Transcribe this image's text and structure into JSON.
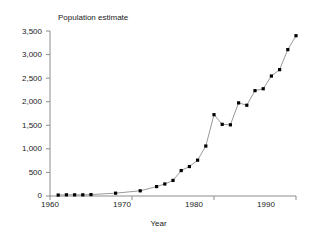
{
  "chart_data": {
    "type": "line",
    "title": "Population estimate",
    "xlabel": "Year",
    "ylabel": "",
    "xlim": [
      1960,
      1990
    ],
    "ylim": [
      0,
      3500
    ],
    "grid": false,
    "legend": null,
    "markers": "filled-square",
    "line_color": "#808080",
    "marker_color": "#000000",
    "axis_color": "#808080",
    "x_ticks": [
      1960,
      1970,
      1980,
      1990
    ],
    "x_tick_labels": [
      "1960",
      "1970",
      "1980",
      "1990"
    ],
    "y_ticks": [
      0,
      500,
      1000,
      1500,
      2000,
      2500,
      3000,
      3500
    ],
    "y_tick_labels": [
      "0",
      "500",
      "1,000",
      "1,500",
      "2,000",
      "2,500",
      "3,000",
      "3,500"
    ],
    "x": [
      1961,
      1962,
      1963,
      1964,
      1965,
      1968,
      1971,
      1973,
      1974,
      1975,
      1976,
      1977,
      1978,
      1979,
      1980,
      1981,
      1982,
      1983,
      1984,
      1985,
      1986,
      1987,
      1988,
      1989,
      1990
    ],
    "values": [
      20,
      25,
      25,
      25,
      30,
      60,
      110,
      200,
      255,
      330,
      540,
      625,
      760,
      1060,
      1725,
      1520,
      1510,
      1975,
      1925,
      2235,
      2275,
      2545,
      2680,
      3105,
      3400
    ],
    "series": [
      {
        "name": "Population estimate",
        "points": [
          {
            "year": 1961,
            "value": 20
          },
          {
            "year": 1962,
            "value": 25
          },
          {
            "year": 1963,
            "value": 25
          },
          {
            "year": 1964,
            "value": 25
          },
          {
            "year": 1965,
            "value": 30
          },
          {
            "year": 1968,
            "value": 60
          },
          {
            "year": 1971,
            "value": 110
          },
          {
            "year": 1973,
            "value": 200
          },
          {
            "year": 1974,
            "value": 255
          },
          {
            "year": 1975,
            "value": 330
          },
          {
            "year": 1976,
            "value": 540
          },
          {
            "year": 1977,
            "value": 625
          },
          {
            "year": 1978,
            "value": 760
          },
          {
            "year": 1979,
            "value": 1060
          },
          {
            "year": 1980,
            "value": 1725
          },
          {
            "year": 1981,
            "value": 1520
          },
          {
            "year": 1982,
            "value": 1510
          },
          {
            "year": 1983,
            "value": 1975
          },
          {
            "year": 1984,
            "value": 1925
          },
          {
            "year": 1985,
            "value": 2235
          },
          {
            "year": 1986,
            "value": 2275
          },
          {
            "year": 1987,
            "value": 2545
          },
          {
            "year": 1988,
            "value": 2680
          },
          {
            "year": 1989,
            "value": 3105
          },
          {
            "year": 1990,
            "value": 3400
          }
        ]
      }
    ]
  },
  "labels": {
    "y0": "0",
    "y500": "500",
    "y1000": "1,000",
    "y1500": "1,500",
    "y2000": "2,000",
    "y2500": "2,500",
    "y3000": "3,000",
    "y3500": "3,500",
    "x1960": "1960",
    "x1970": "1970",
    "x1980": "1980",
    "x1990": "1990"
  }
}
